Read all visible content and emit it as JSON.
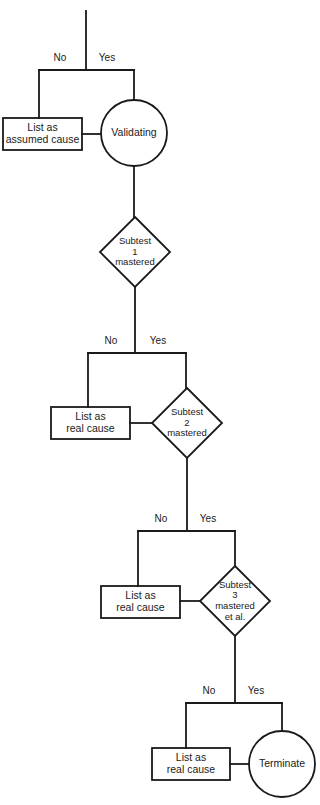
{
  "diagram": {
    "background_color": "#ffffff",
    "stroke_color": "#1a1a1a",
    "text_color": "#1a1a1a",
    "nodes": [
      {
        "id": "list-assumed-cause",
        "type": "process-box",
        "label": "List as\nassumed cause",
        "x": 3,
        "y": 118,
        "w": 79,
        "h": 32
      },
      {
        "id": "validating",
        "type": "terminator-circle",
        "label": "Validating",
        "cx": 134,
        "cy": 133,
        "r": 33
      },
      {
        "id": "subtest-1",
        "type": "decision-diamond",
        "label": "Subtest\n1\nmastered",
        "cx": 135,
        "cy": 252,
        "rx": 35,
        "ry": 35
      },
      {
        "id": "list-real-cause-1",
        "type": "process-box",
        "label": "List as\nreal cause",
        "x": 51,
        "y": 407,
        "w": 79,
        "h": 32
      },
      {
        "id": "subtest-2",
        "type": "decision-diamond",
        "label": "Subtest\n2\nmastered",
        "cx": 187,
        "cy": 423,
        "rx": 35,
        "ry": 35
      },
      {
        "id": "list-real-cause-2",
        "type": "process-box",
        "label": "List as\nreal cause",
        "x": 101,
        "y": 586,
        "w": 79,
        "h": 32
      },
      {
        "id": "subtest-3",
        "type": "decision-diamond",
        "label": "Subtest\n3\nmastered\net al.",
        "cx": 235,
        "cy": 601,
        "rx": 35,
        "ry": 35
      },
      {
        "id": "list-real-cause-3",
        "type": "process-box",
        "label": "List as\nreal cause",
        "x": 152,
        "y": 748,
        "w": 78,
        "h": 32
      },
      {
        "id": "terminate",
        "type": "terminator-circle",
        "label": "Terminate",
        "cx": 282,
        "cy": 764,
        "r": 33
      }
    ],
    "edge_labels": [
      {
        "id": "branch-1-no",
        "text": "No",
        "x": 45,
        "y": 52
      },
      {
        "id": "branch-1-yes",
        "text": "Yes",
        "x": 92,
        "y": 52
      },
      {
        "id": "branch-2-no",
        "text": "No",
        "x": 96,
        "y": 335
      },
      {
        "id": "branch-2-yes",
        "text": "Yes",
        "x": 143,
        "y": 335
      },
      {
        "id": "branch-3-no",
        "text": "No",
        "x": 146,
        "y": 513
      },
      {
        "id": "branch-3-yes",
        "text": "Yes",
        "x": 193,
        "y": 513
      },
      {
        "id": "branch-4-no",
        "text": "No",
        "x": 194,
        "y": 685
      },
      {
        "id": "branch-4-yes",
        "text": "Yes",
        "x": 241,
        "y": 685
      }
    ]
  }
}
